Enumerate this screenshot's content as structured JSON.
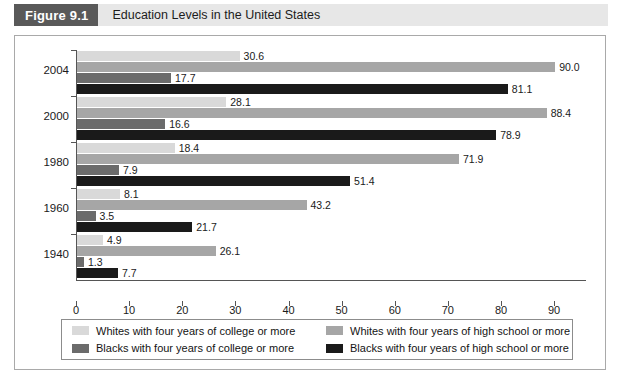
{
  "header": {
    "badge_label": "Figure 9.1",
    "title": "Education Levels in the United States"
  },
  "chart_data": {
    "type": "bar",
    "orientation": "horizontal",
    "title": "Education Levels in the United States",
    "xlabel": "Percentage",
    "ylabel": "",
    "xlim": [
      0,
      96
    ],
    "xticks": [
      0,
      10,
      20,
      30,
      40,
      50,
      60,
      70,
      80,
      90
    ],
    "xtick_labels": [
      "0",
      "10",
      "20",
      "30",
      "40",
      "50",
      "60",
      "70",
      "80",
      "90"
    ],
    "grid": false,
    "legend_position": "bottom",
    "categories": [
      "2004",
      "2000",
      "1980",
      "1960",
      "1940"
    ],
    "series": [
      {
        "name": "Whites with four years of college or more",
        "color": "#d9d9d9",
        "values": [
          30.6,
          28.1,
          18.4,
          8.1,
          4.9
        ],
        "labels": [
          "30.6",
          "28.1",
          "18.4",
          "8.1",
          "4.9"
        ]
      },
      {
        "name": "Whites with four years of high school or more",
        "color": "#a6a6a6",
        "values": [
          90.0,
          88.4,
          71.9,
          43.2,
          26.1
        ],
        "labels": [
          "90.0",
          "88.4",
          "71.9",
          "43.2",
          "26.1"
        ]
      },
      {
        "name": "Blacks with four years of college or more",
        "color": "#6b6b6b",
        "values": [
          17.7,
          16.6,
          7.9,
          3.5,
          1.3
        ],
        "labels": [
          "17.7",
          "16.6",
          "7.9",
          "3.5",
          "1.3"
        ]
      },
      {
        "name": "Blacks with four years of high school or more",
        "color": "#1a1a1a",
        "values": [
          81.1,
          78.9,
          51.4,
          21.7,
          7.7
        ],
        "labels": [
          "81.1",
          "78.9",
          "51.4",
          "21.7",
          "7.7"
        ]
      }
    ]
  },
  "legend": {
    "items": [
      {
        "label": "Whites with four years of college or more",
        "color": "#d9d9d9"
      },
      {
        "label": "Whites with four years of high school or more",
        "color": "#a6a6a6"
      },
      {
        "label": "Blacks with four years of college or more",
        "color": "#6b6b6b"
      },
      {
        "label": "Blacks with four years of high school or more",
        "color": "#1a1a1a"
      }
    ]
  },
  "colors": {
    "badge_bg": "#595959",
    "header_bg": "#e7e7e7",
    "frame_border": "#a9a9a9",
    "axis": "#555555"
  }
}
